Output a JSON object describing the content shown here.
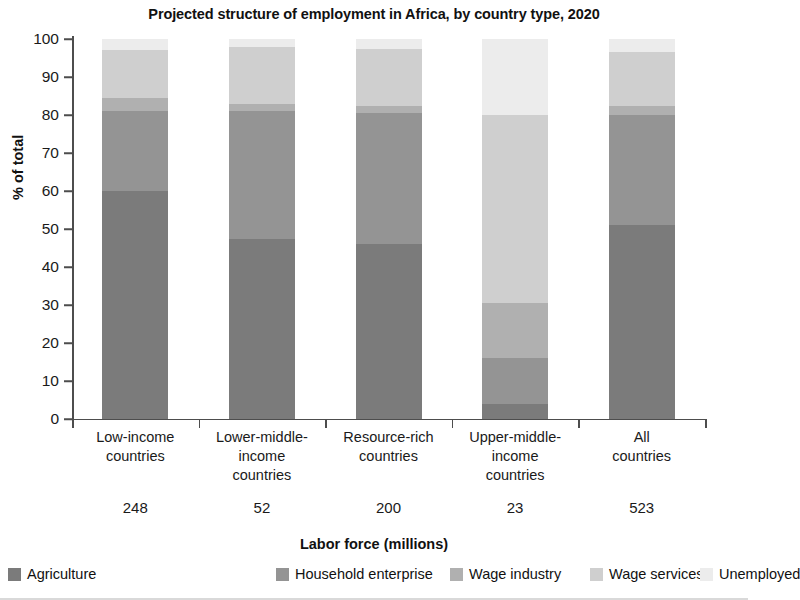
{
  "chart_data": {
    "type": "bar",
    "subtype": "stacked-100-percent",
    "title": "Projected structure of employment in Africa, by country type, 2020",
    "xlabel": "Labor force (millions)",
    "ylabel": "% of total",
    "ylim": [
      0,
      100
    ],
    "yticks": [
      0,
      10,
      20,
      30,
      40,
      50,
      60,
      70,
      80,
      90,
      100
    ],
    "grid": false,
    "legend_position": "bottom",
    "categories": [
      "Low-income\ncountries",
      "Lower-middle-\nincome\ncountries",
      "Resource-rich\ncountries",
      "Upper-middle-\nincome\ncountries",
      "All\ncountries"
    ],
    "category_values": [
      "248",
      "52",
      "200",
      "23",
      "523"
    ],
    "series": [
      {
        "name": "Agriculture",
        "color": "#7b7b7b",
        "values": [
          60.0,
          47.5,
          46.0,
          4.0,
          51.0
        ]
      },
      {
        "name": "Household enterprise",
        "color": "#949494",
        "values": [
          21.0,
          33.5,
          34.5,
          12.0,
          29.0
        ]
      },
      {
        "name": "Wage industry",
        "color": "#b0b0b0",
        "values": [
          3.5,
          2.0,
          2.0,
          14.5,
          2.5
        ]
      },
      {
        "name": "Wage services",
        "color": "#cfcfcf",
        "values": [
          12.5,
          15.0,
          15.0,
          49.5,
          14.0
        ]
      },
      {
        "name": "Unemployed",
        "color": "#ececec",
        "values": [
          3.0,
          2.0,
          2.5,
          20.0,
          3.5
        ]
      }
    ]
  }
}
